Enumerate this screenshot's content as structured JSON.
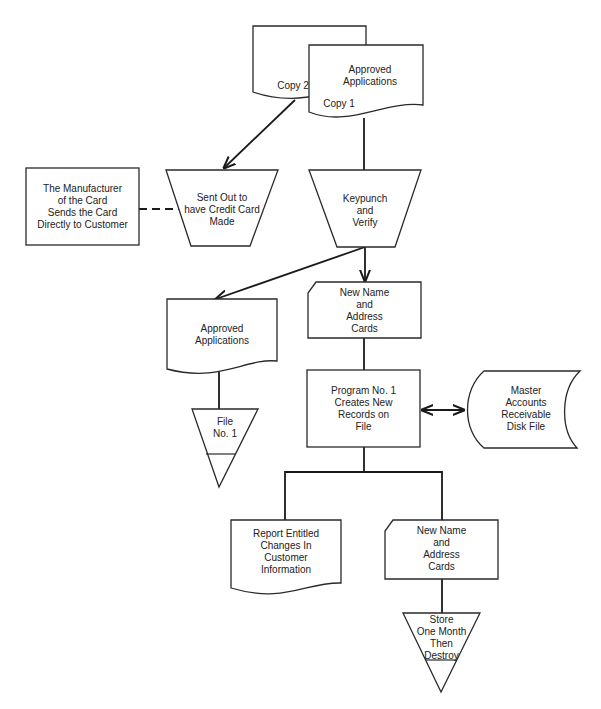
{
  "diagram": {
    "type": "system flowchart",
    "nodes": {
      "copy2_document": {
        "shape": "document",
        "label": "Copy  2"
      },
      "copy1_document": {
        "shape": "document",
        "title": "Approved\nApplications",
        "label": "Copy  1"
      },
      "manufacturer_box": {
        "shape": "process-rectangle",
        "label": "The Manufacturer\nof the Card\nSends the Card\nDirectly to Customer"
      },
      "sent_out_manual": {
        "shape": "manual-operation-trapezoid",
        "label": "Sent Out to\nhave Credit Card\nMade"
      },
      "keypunch_manual": {
        "shape": "manual-operation-trapezoid",
        "label": "Keypunch\nand\nVerify"
      },
      "approved_apps_document": {
        "shape": "document",
        "label": "Approved\nApplications"
      },
      "file_no1_offline": {
        "shape": "offline-storage-triangle",
        "label": "File\nNo. 1"
      },
      "new_cards_1": {
        "shape": "punched-card",
        "label": "New  Name\nand\nAddress\nCards"
      },
      "program_process": {
        "shape": "process-rectangle",
        "label": "Program No. 1\nCreates New\nRecords on\nFile"
      },
      "disk_file": {
        "shape": "online-storage",
        "label": "Master\nAccounts\nReceivable\nDisk File"
      },
      "report_document": {
        "shape": "document",
        "label": "Report Entitled\nChanges In\nCustomer\nInformation"
      },
      "new_cards_2": {
        "shape": "punched-card",
        "label": "New Name\nand\nAddress\nCards"
      },
      "store_offline": {
        "shape": "offline-storage-triangle",
        "label": "Store\nOne Month\nThen\nDestroy"
      }
    },
    "edges": [
      {
        "from": "copy2_document",
        "to": "sent_out_manual",
        "style": "solid-arrow"
      },
      {
        "from": "copy1_document",
        "to": "keypunch_manual",
        "style": "solid"
      },
      {
        "from": "manufacturer_box",
        "to": "sent_out_manual",
        "style": "dashed"
      },
      {
        "from": "keypunch_manual",
        "to": "approved_apps_document",
        "style": "solid-arrow"
      },
      {
        "from": "keypunch_manual",
        "to": "new_cards_1",
        "style": "solid-arrow"
      },
      {
        "from": "approved_apps_document",
        "to": "file_no1_offline",
        "style": "solid"
      },
      {
        "from": "new_cards_1",
        "to": "program_process",
        "style": "solid"
      },
      {
        "from": "program_process",
        "to": "disk_file",
        "style": "bidirectional-arrow"
      },
      {
        "from": "program_process",
        "to": "report_document",
        "style": "solid"
      },
      {
        "from": "program_process",
        "to": "new_cards_2",
        "style": "solid"
      },
      {
        "from": "new_cards_2",
        "to": "store_offline",
        "style": "solid"
      }
    ]
  }
}
